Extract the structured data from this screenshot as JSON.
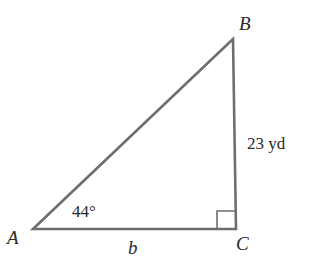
{
  "diagram": {
    "type": "right-triangle",
    "colors": {
      "stroke": "#6e6e6e",
      "text": "#2a2a2a",
      "background": "#ffffff"
    },
    "vertices": {
      "A": {
        "label": "A",
        "x": 33,
        "y": 229
      },
      "B": {
        "label": "B",
        "x": 233,
        "y": 39
      },
      "C": {
        "label": "C",
        "x": 236,
        "y": 229
      }
    },
    "angle_A": {
      "label": "44°",
      "value_deg": 44
    },
    "right_angle_at": "C",
    "sides": {
      "BC": {
        "label": "23 yd",
        "value": 23,
        "unit": "yd"
      },
      "AC": {
        "label": "b"
      }
    }
  }
}
